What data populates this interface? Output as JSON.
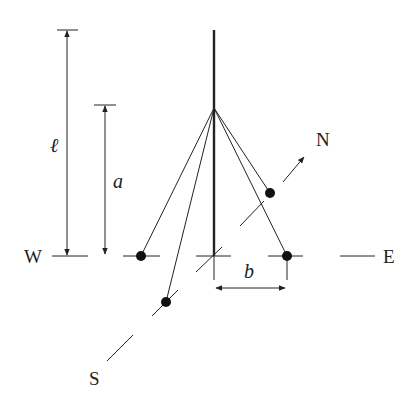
{
  "labels": {
    "length_symbol": "ℓ",
    "height_symbol": "a",
    "offset_symbol": "b",
    "west": "W",
    "east": "E",
    "north": "N",
    "south": "S"
  },
  "colors": {
    "ink": "#222222",
    "background": "#ffffff"
  }
}
